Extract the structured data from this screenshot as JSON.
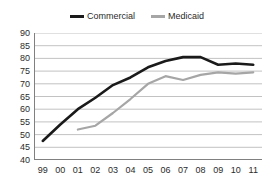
{
  "chart_data": {
    "type": "line",
    "title": "",
    "subtitle": "",
    "xlabel": "",
    "ylabel": "",
    "xlim": [
      0,
      12
    ],
    "ylim": [
      40,
      90
    ],
    "y_ticks": [
      40,
      45,
      50,
      55,
      60,
      65,
      70,
      75,
      80,
      85,
      90
    ],
    "grid": true,
    "grid_axis": "y",
    "legend_position": "top-center",
    "categories": [
      "99",
      "00",
      "01",
      "02",
      "03",
      "04",
      "05",
      "06",
      "07",
      "08",
      "09",
      "10",
      "11"
    ],
    "series": [
      {
        "name": "Commercial",
        "color": "#1a1a1a",
        "line_width": 2.6,
        "values": [
          47.5,
          54.0,
          60.0,
          64.5,
          69.5,
          72.5,
          76.5,
          79.0,
          80.5,
          80.5,
          77.5,
          78.0,
          77.5
        ]
      },
      {
        "name": "Medicaid",
        "color": "#a6a6a6",
        "line_width": 2.2,
        "values": [
          null,
          null,
          52.0,
          53.5,
          58.5,
          64.0,
          70.0,
          73.0,
          71.5,
          73.5,
          74.5,
          74.0,
          74.5
        ]
      }
    ]
  },
  "legend": {
    "items": [
      {
        "label": "Commercial",
        "swatch": "commercial-line-swatch"
      },
      {
        "label": "Medicaid",
        "swatch": "medicaid-line-swatch"
      }
    ]
  },
  "colors": {
    "commercial": "#1a1a1a",
    "medicaid": "#a6a6a6",
    "gridline": "#b3b3b3",
    "axis": "#808080",
    "text": "#2b2b2b",
    "background": "#ffffff"
  }
}
